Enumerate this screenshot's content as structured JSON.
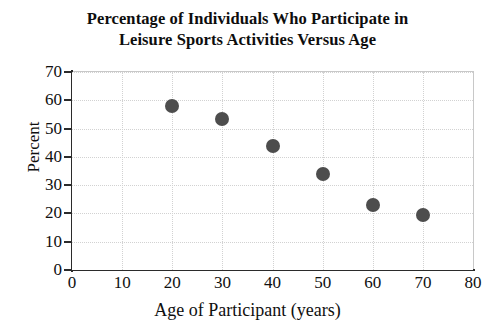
{
  "chart_data": {
    "type": "scatter",
    "title": "Percentage of Individuals Who Participate in Leisure Sports Activities Versus Age",
    "title_lines": [
      "Percentage of Individuals Who Participate in",
      "Leisure Sports Activities Versus Age"
    ],
    "xlabel": "Age of Participant (years)",
    "ylabel": "Percent",
    "xlim": [
      0,
      80
    ],
    "ylim": [
      0,
      70
    ],
    "xticks": [
      0,
      10,
      20,
      30,
      40,
      50,
      60,
      70,
      80
    ],
    "yticks": [
      0,
      10,
      20,
      30,
      40,
      50,
      60,
      70
    ],
    "grid": true,
    "legend": "none",
    "marker_color": "#4d4d4d",
    "x": [
      20,
      30,
      40,
      50,
      60,
      70
    ],
    "y": [
      58,
      53.5,
      44,
      34,
      23,
      19.5
    ],
    "points": [
      {
        "x": 20,
        "y": 58
      },
      {
        "x": 30,
        "y": 53.5
      },
      {
        "x": 40,
        "y": 44
      },
      {
        "x": 50,
        "y": 34
      },
      {
        "x": 60,
        "y": 23
      },
      {
        "x": 70,
        "y": 19.5
      }
    ],
    "origin_label": "0"
  }
}
